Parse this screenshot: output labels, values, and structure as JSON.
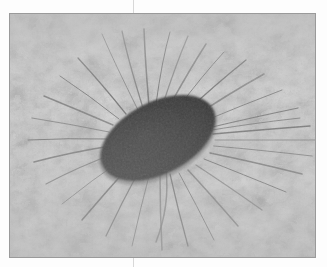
{
  "page": {
    "background_color": "#fdfdfd",
    "crop_marks": [
      {
        "name": "top-crop-mark",
        "color": "#d8d8d8"
      },
      {
        "name": "bottom-crop-mark",
        "color": "#d8d8d8"
      }
    ]
  },
  "photo": {
    "frame_border_color": "#9a9a9a",
    "background_color": "#c9c9c9",
    "subject": "bacterium with peritrichous flagella",
    "technique": "transmission electron micrograph, negative stain",
    "alt_text": "Electron micrograph of a rod-shaped bacterial cell with numerous long flagella radiating in all directions"
  },
  "chart_data": {
    "type": "scatter",
    "title": "",
    "xlabel": "",
    "ylabel": "",
    "colors": {
      "stain_background_light": "#cfcfcf",
      "stain_background_mid": "#bdbdbd",
      "stain_background_dark": "#ababab",
      "cell_body": "#3b3b3b",
      "cell_body_edge": "#4a4a4a",
      "flagellum": "#6f6f6f",
      "frame": "#9a9a9a"
    },
    "cell": {
      "center_x": 148,
      "center_y": 124,
      "radius_x": 62,
      "radius_y": 36,
      "rotation_deg": -28
    },
    "flagella_count": 34,
    "flagella": [
      {
        "x1": 128,
        "y1": 96,
        "cx": 104,
        "cy": 48,
        "x2": 92,
        "y2": 20
      },
      {
        "x1": 133,
        "y1": 94,
        "cx": 118,
        "cy": 46,
        "x2": 112,
        "y2": 17
      },
      {
        "x1": 139,
        "y1": 92,
        "cx": 135,
        "cy": 44,
        "x2": 134,
        "y2": 15
      },
      {
        "x1": 146,
        "y1": 90,
        "cx": 152,
        "cy": 46,
        "x2": 160,
        "y2": 18
      },
      {
        "x1": 153,
        "y1": 90,
        "cx": 166,
        "cy": 50,
        "x2": 178,
        "y2": 22
      },
      {
        "x1": 160,
        "y1": 91,
        "cx": 180,
        "cy": 55,
        "x2": 196,
        "y2": 30
      },
      {
        "x1": 168,
        "y1": 94,
        "cx": 192,
        "cy": 62,
        "x2": 214,
        "y2": 38
      },
      {
        "x1": 176,
        "y1": 98,
        "cx": 206,
        "cy": 70,
        "x2": 236,
        "y2": 46
      },
      {
        "x1": 184,
        "y1": 103,
        "cx": 218,
        "cy": 80,
        "x2": 254,
        "y2": 60
      },
      {
        "x1": 192,
        "y1": 108,
        "cx": 230,
        "cy": 92,
        "x2": 272,
        "y2": 76
      },
      {
        "x1": 198,
        "y1": 114,
        "cx": 240,
        "cy": 104,
        "x2": 288,
        "y2": 94
      },
      {
        "x1": 203,
        "y1": 120,
        "cx": 248,
        "cy": 116,
        "x2": 300,
        "y2": 112
      },
      {
        "x1": 205,
        "y1": 126,
        "cx": 252,
        "cy": 126,
        "x2": 306,
        "y2": 126
      },
      {
        "x1": 204,
        "y1": 132,
        "cx": 250,
        "cy": 136,
        "x2": 302,
        "y2": 142
      },
      {
        "x1": 200,
        "y1": 139,
        "cx": 244,
        "cy": 148,
        "x2": 292,
        "y2": 160
      },
      {
        "x1": 194,
        "y1": 145,
        "cx": 232,
        "cy": 160,
        "x2": 276,
        "y2": 178
      },
      {
        "x1": 186,
        "y1": 151,
        "cx": 218,
        "cy": 172,
        "x2": 252,
        "y2": 196
      },
      {
        "x1": 178,
        "y1": 156,
        "cx": 202,
        "cy": 182,
        "x2": 228,
        "y2": 212
      },
      {
        "x1": 169,
        "y1": 159,
        "cx": 186,
        "cy": 190,
        "x2": 204,
        "y2": 226
      },
      {
        "x1": 160,
        "y1": 160,
        "cx": 168,
        "cy": 196,
        "x2": 178,
        "y2": 232
      },
      {
        "x1": 150,
        "y1": 160,
        "cx": 150,
        "cy": 198,
        "x2": 152,
        "y2": 236
      },
      {
        "x1": 140,
        "y1": 158,
        "cx": 130,
        "cy": 196,
        "x2": 122,
        "y2": 232
      },
      {
        "x1": 130,
        "y1": 155,
        "cx": 112,
        "cy": 188,
        "x2": 96,
        "y2": 222
      },
      {
        "x1": 121,
        "y1": 150,
        "cx": 96,
        "cy": 178,
        "x2": 72,
        "y2": 206
      },
      {
        "x1": 113,
        "y1": 145,
        "cx": 82,
        "cy": 166,
        "x2": 52,
        "y2": 190
      },
      {
        "x1": 106,
        "y1": 139,
        "cx": 70,
        "cy": 152,
        "x2": 36,
        "y2": 170
      },
      {
        "x1": 101,
        "y1": 132,
        "cx": 62,
        "cy": 138,
        "x2": 24,
        "y2": 148
      },
      {
        "x1": 98,
        "y1": 125,
        "cx": 58,
        "cy": 124,
        "x2": 18,
        "y2": 126
      },
      {
        "x1": 99,
        "y1": 118,
        "cx": 60,
        "cy": 110,
        "x2": 22,
        "y2": 104
      },
      {
        "x1": 103,
        "y1": 111,
        "cx": 68,
        "cy": 96,
        "x2": 34,
        "y2": 82
      },
      {
        "x1": 109,
        "y1": 105,
        "cx": 80,
        "cy": 82,
        "x2": 50,
        "y2": 62
      },
      {
        "x1": 116,
        "y1": 100,
        "cx": 92,
        "cy": 70,
        "x2": 68,
        "y2": 44
      },
      {
        "x1": 156,
        "y1": 156,
        "cx": 160,
        "cy": 192,
        "x2": 146,
        "y2": 228
      },
      {
        "x1": 190,
        "y1": 118,
        "cx": 236,
        "cy": 110,
        "x2": 290,
        "y2": 104
      }
    ]
  }
}
